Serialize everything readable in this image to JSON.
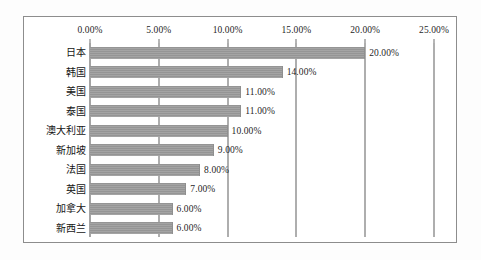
{
  "chart_data": {
    "type": "bar",
    "orientation": "horizontal",
    "title": "",
    "subtitle": "",
    "xlabel": "",
    "ylabel": "",
    "categories": [
      "日本",
      "韩国",
      "美国",
      "泰国",
      "澳大利亚",
      "新加坡",
      "法国",
      "英国",
      "加拿大",
      "新西兰"
    ],
    "values": [
      20.0,
      14.0,
      11.0,
      11.0,
      10.0,
      9.0,
      8.0,
      7.0,
      6.0,
      6.0
    ],
    "value_labels": [
      "20.00%",
      "14.00%",
      "11.00%",
      "11.00%",
      "10.00%",
      "9.00%",
      "8.00%",
      "7.00%",
      "6.00%",
      "6.00%"
    ],
    "xlim": [
      0,
      25
    ],
    "xticks": [
      0,
      5,
      10,
      15,
      20,
      25
    ],
    "xtick_labels": [
      "0.00%",
      "5.00%",
      "10.00%",
      "15.00%",
      "20.00%",
      "25.00%"
    ],
    "grid": true,
    "grid_axis": "x",
    "legend": false,
    "legend_position": "none",
    "bar_color": "#9a9a9a",
    "gridline_color": "#5f5f5f",
    "frame_color": "#8d8d8d",
    "background_color": "#ffffff",
    "data_labels_shown": true,
    "units": "percent"
  }
}
